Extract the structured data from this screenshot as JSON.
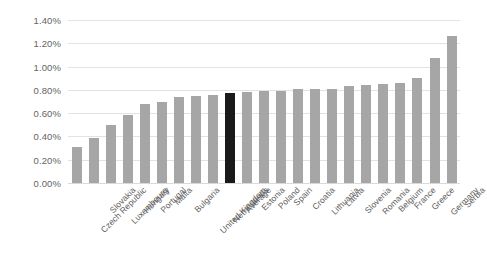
{
  "chart_data": {
    "type": "bar",
    "title": "",
    "subtitle": "",
    "xlabel": "",
    "ylabel": "",
    "ylim": [
      0,
      0.014
    ],
    "grid": true,
    "legend": false,
    "y_tick_labels": [
      "1.40%",
      "1.20%",
      "1.00%",
      "0.80%",
      "0.60%",
      "0.40%",
      "0.20%",
      "0.00%"
    ],
    "y_tick_values": [
      1.4,
      1.2,
      1.0,
      0.8,
      0.6,
      0.4,
      0.2,
      0.0
    ],
    "value_unit": "%",
    "categories": [
      "Czech Republic",
      "Slovakia",
      "Luxembourg",
      "Hungary",
      "Portugal",
      "Malta",
      "Bulgaria",
      "United Kingdom",
      "Netherlands",
      "Average",
      "Estonia",
      "Poland",
      "Spain",
      "Croatia",
      "Lithuania",
      "Latvia",
      "Slovenia",
      "Romania",
      "Belgium",
      "France",
      "Greece",
      "Germany",
      "Serbia"
    ],
    "values": [
      0.31,
      0.39,
      0.5,
      0.58,
      0.68,
      0.7,
      0.74,
      0.75,
      0.76,
      0.77,
      0.78,
      0.79,
      0.79,
      0.81,
      0.81,
      0.81,
      0.83,
      0.84,
      0.85,
      0.86,
      0.9,
      1.07,
      1.26
    ],
    "highlight_category": "Average",
    "colors": {
      "bar": "#a6a6a6",
      "highlight_bar": "#1a1a1a",
      "gridline": "#e2e2e2",
      "background": "#ffffff",
      "tick_text": "#646464",
      "category_text": "#5e5e5e"
    }
  }
}
